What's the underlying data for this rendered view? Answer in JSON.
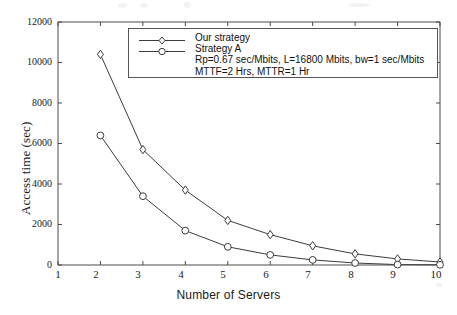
{
  "chart_data": {
    "type": "line",
    "title": "",
    "xlabel": "Number of Servers",
    "ylabel": "Access time (sec)",
    "xlim": [
      1,
      10
    ],
    "ylim": [
      0,
      12000
    ],
    "grid": false,
    "legend_position": "top-center",
    "x_ticks": [
      "1",
      "2",
      "3",
      "4",
      "5",
      "6",
      "7",
      "8",
      "9",
      "10"
    ],
    "y_ticks": [
      "0",
      "2000",
      "4000",
      "6000",
      "8000",
      "10000",
      "12000"
    ],
    "x": [
      2,
      3,
      4,
      5,
      6,
      7,
      8,
      9,
      10
    ],
    "series": [
      {
        "name": "Our strategy",
        "marker": "diamond",
        "color": "#3c3c3c",
        "values": [
          10400,
          5700,
          3700,
          2200,
          1500,
          950,
          550,
          300,
          150
        ]
      },
      {
        "name": "Strategy A",
        "marker": "circle",
        "color": "#3c3c3c",
        "values": [
          6400,
          3400,
          1700,
          900,
          500,
          250,
          100,
          20,
          10
        ]
      }
    ],
    "annotations": [
      "Rp=0.67 sec/Mbits, L=16800 Mbits, bw=1 sec/Mbits",
      "MTTF=2 Hrs, MTTR=1 Hr"
    ]
  },
  "legend": {
    "entry_our_strategy": "Our strategy",
    "entry_strategy_a": "Strategy A",
    "note_line_1": "Rp=0.67 sec/Mbits, L=16800 Mbits, bw=1 sec/Mbits",
    "note_line_2": "MTTF=2 Hrs, MTTR=1 Hr"
  },
  "axes": {
    "x_label": "Number of Servers",
    "y_label": "Access time (sec)",
    "x_tick_1": "1",
    "x_tick_2": "2",
    "x_tick_3": "3",
    "x_tick_4": "4",
    "x_tick_5": "5",
    "x_tick_6": "6",
    "x_tick_7": "7",
    "x_tick_8": "8",
    "x_tick_9": "9",
    "x_tick_10": "10",
    "y_tick_0": "0",
    "y_tick_2000": "2000",
    "y_tick_4000": "4000",
    "y_tick_6000": "6000",
    "y_tick_8000": "8000",
    "y_tick_10000": "10000",
    "y_tick_12000": "12000"
  }
}
